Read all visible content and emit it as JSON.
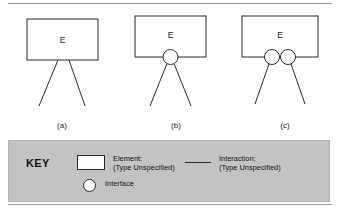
{
  "figure": {
    "name": "element-interface-interaction-diagram",
    "diagrams": [
      {
        "id": "a",
        "label": "(a)",
        "element_label": "E",
        "interfaces": 0,
        "interactions": 2
      },
      {
        "id": "b",
        "label": "(b)",
        "element_label": "E",
        "interfaces": 1,
        "interactions": 2
      },
      {
        "id": "c",
        "label": "(c)",
        "element_label": "E",
        "interfaces": 2,
        "interactions": 2
      }
    ]
  },
  "key": {
    "title": "KEY",
    "entries": [
      {
        "symbol": "rectangle",
        "line1": "Element;",
        "line2": "(Type Unspecified)"
      },
      {
        "symbol": "line",
        "line1": "Interaction;",
        "line2": "(Type Unspecified)"
      },
      {
        "symbol": "circle",
        "line1": "Interface",
        "line2": ""
      }
    ]
  },
  "colors": {
    "stroke": "#2b2b2b",
    "key_background": "#c3c3c3",
    "page_background": "#ffffff",
    "rule": "#9a9a9a"
  }
}
